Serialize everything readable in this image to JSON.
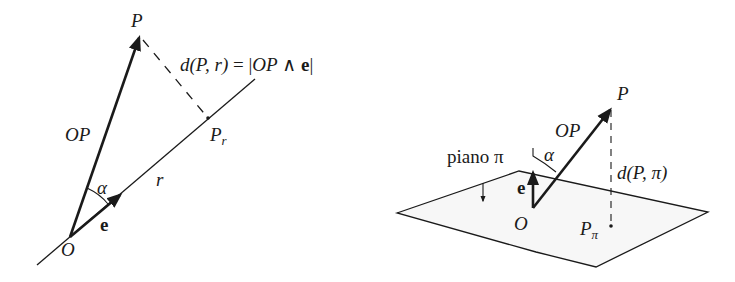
{
  "left_figure": {
    "labels": {
      "P": "P",
      "P_r_base": "P",
      "P_r_sub": "r",
      "OP": "OP",
      "r": "r",
      "alpha": "α",
      "e": "e",
      "O": "O"
    },
    "formula": {
      "lhs": "d(P, r)",
      "eq": "=",
      "rhs_open": "|",
      "rhs_vec": "OP",
      "rhs_wedge": "∧",
      "rhs_e": "e",
      "rhs_close": "|"
    }
  },
  "right_figure": {
    "labels": {
      "P": "P",
      "OP": "OP",
      "alpha": "α",
      "plane": "piano π",
      "distance": "d(P, π)",
      "e": "e",
      "O": "O",
      "P_pi_base": "P",
      "P_pi_sub": "π"
    }
  },
  "colors": {
    "ink": "#1a1a1a",
    "plane_fill": "#f7f7f7",
    "background": "#ffffff"
  }
}
